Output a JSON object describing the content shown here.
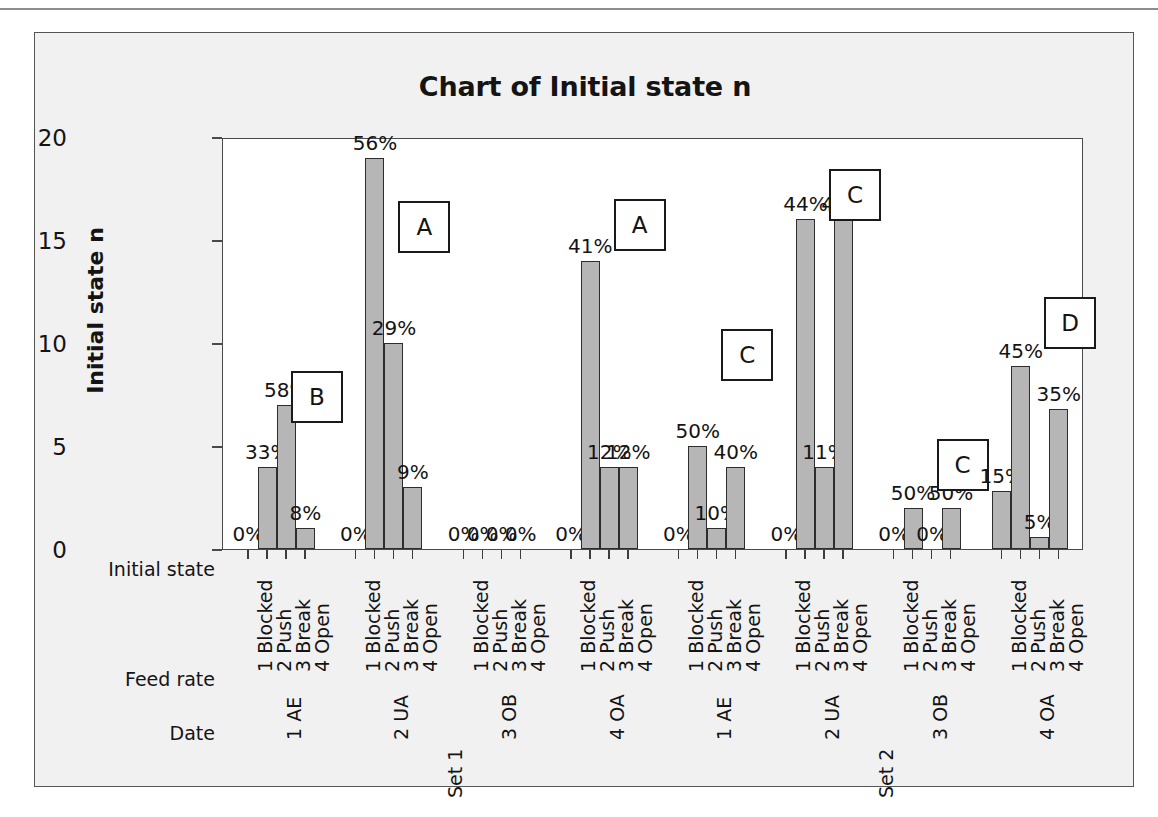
{
  "chart_data": {
    "type": "bar",
    "title": "Chart of Initial state n",
    "xlabel": "Initial state",
    "ylabel": "Initial state n",
    "ylim": [
      0,
      20
    ],
    "yticks": [
      0,
      5,
      10,
      15,
      20
    ],
    "grid": false,
    "legend": "none",
    "axis_row_headers": [
      "Initial state",
      "Feed rate",
      "Date"
    ],
    "categories": [
      "1 Blocked",
      "2 Push",
      "3 Break",
      "4 Open"
    ],
    "sets": [
      "Set 1",
      "Set 2"
    ],
    "groups": [
      {
        "set": "Set 1",
        "feed_rate": "1 AE",
        "annotation": "B",
        "values": [
          0,
          4,
          7,
          1
        ],
        "labels": [
          "0%",
          "33%",
          "58%",
          "8%"
        ]
      },
      {
        "set": "Set 1",
        "feed_rate": "2 UA",
        "annotation": "A",
        "values": [
          0,
          19,
          10,
          3
        ],
        "labels": [
          "0%",
          "56%",
          "29%",
          "9%"
        ]
      },
      {
        "set": "Set 1",
        "feed_rate": "3 OB",
        "annotation": "",
        "values": [
          0,
          0,
          0,
          0
        ],
        "labels": [
          "0%",
          "0%",
          "0%",
          "0%"
        ]
      },
      {
        "set": "Set 1",
        "feed_rate": "4 OA",
        "annotation": "A",
        "values": [
          0,
          14,
          4,
          4
        ],
        "labels": [
          "0%",
          "41%",
          "12%",
          "12%"
        ]
      },
      {
        "set": "Set 2",
        "feed_rate": "1 AE",
        "annotation": "C",
        "values": [
          0,
          5,
          1,
          4
        ],
        "labels": [
          "0%",
          "50%",
          "10%",
          "40%"
        ]
      },
      {
        "set": "Set 2",
        "feed_rate": "2 UA",
        "annotation": "C",
        "values": [
          0,
          16,
          4,
          16
        ],
        "labels": [
          "0%",
          "44%",
          "11%",
          "44%"
        ]
      },
      {
        "set": "Set 2",
        "feed_rate": "3 OB",
        "annotation": "C",
        "values": [
          0,
          2,
          0,
          2
        ],
        "labels": [
          "0%",
          "50%",
          "0%",
          "50%"
        ]
      },
      {
        "set": "Set 2",
        "feed_rate": "4 OA",
        "annotation": "D",
        "values": [
          2.8,
          8.9,
          0.6,
          6.8
        ],
        "labels": [
          "15%",
          "45%",
          "5%",
          "35%"
        ]
      }
    ],
    "colors": {
      "bar_fill": "#b6b6b6",
      "bar_border": "#2d2d2d",
      "plot_background": "#ffffff",
      "chart_background": "#f1f1f1",
      "text": "#141414"
    }
  }
}
